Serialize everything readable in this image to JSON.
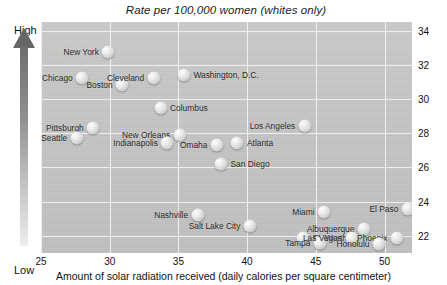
{
  "chart_data": {
    "type": "scatter",
    "title": "Rate per 100,000 women (whites only)",
    "xlabel": "Amount of solar radiation received (daily calories per square centimeter)",
    "ylabel": "Rate per 100,000 women (whites only)",
    "xlim": [
      25,
      52
    ],
    "ylim": [
      21,
      34.5
    ],
    "xticks": [
      25,
      30,
      35,
      40,
      45,
      50
    ],
    "yticks": [
      22,
      24,
      26,
      28,
      30,
      32,
      34
    ],
    "grid": true,
    "legend": null,
    "vertical_axis_annotation": {
      "top": "High",
      "bottom": "Low"
    },
    "points": [
      {
        "label": "New York",
        "x": 29.9,
        "y": 32.75,
        "label_side": "left"
      },
      {
        "label": "Chicago",
        "x": 28.0,
        "y": 31.2,
        "label_side": "left"
      },
      {
        "label": "Boston",
        "x": 30.9,
        "y": 30.8,
        "label_side": "left"
      },
      {
        "label": "Cleveland",
        "x": 33.2,
        "y": 31.2,
        "label_side": "left"
      },
      {
        "label": "Washington, D.C.",
        "x": 35.4,
        "y": 31.4,
        "label_side": "right"
      },
      {
        "label": "Pittsburgh",
        "x": 28.8,
        "y": 28.3,
        "label_side": "left"
      },
      {
        "label": "Columbus",
        "x": 33.7,
        "y": 29.5,
        "label_side": "right"
      },
      {
        "label": "Seattle",
        "x": 27.6,
        "y": 27.7,
        "label_side": "left"
      },
      {
        "label": "New Orleans",
        "x": 35.1,
        "y": 27.9,
        "label_side": "left"
      },
      {
        "label": "Indianapolis",
        "x": 34.2,
        "y": 27.4,
        "label_side": "left"
      },
      {
        "label": "Omaha",
        "x": 37.8,
        "y": 27.3,
        "label_side": "left"
      },
      {
        "label": "Atlanta",
        "x": 39.3,
        "y": 27.4,
        "label_side": "right"
      },
      {
        "label": "San Diego",
        "x": 38.1,
        "y": 26.2,
        "label_side": "right"
      },
      {
        "label": "Los Angeles",
        "x": 44.2,
        "y": 28.4,
        "label_side": "left"
      },
      {
        "label": "Nashville",
        "x": 36.4,
        "y": 23.2,
        "label_side": "left"
      },
      {
        "label": "Salt Lake City",
        "x": 40.2,
        "y": 22.6,
        "label_side": "left"
      },
      {
        "label": "Miami",
        "x": 45.6,
        "y": 23.4,
        "label_side": "left"
      },
      {
        "label": "El Paso",
        "x": 51.7,
        "y": 23.6,
        "label_side": "left"
      },
      {
        "label": "Ft. Worth",
        "x": 44.1,
        "y": 21.9,
        "label_side": "right"
      },
      {
        "label": "Tampa",
        "x": 45.3,
        "y": 21.6,
        "label_side": "left"
      },
      {
        "label": "Albuquerque",
        "x": 48.5,
        "y": 22.4,
        "label_side": "left"
      },
      {
        "label": "Las Vegas",
        "x": 47.6,
        "y": 21.9,
        "label_side": "left"
      },
      {
        "label": "Phoenix",
        "x": 50.9,
        "y": 21.9,
        "label_side": "left"
      },
      {
        "label": "Honolulu",
        "x": 49.6,
        "y": 21.5,
        "label_side": "left"
      }
    ]
  }
}
